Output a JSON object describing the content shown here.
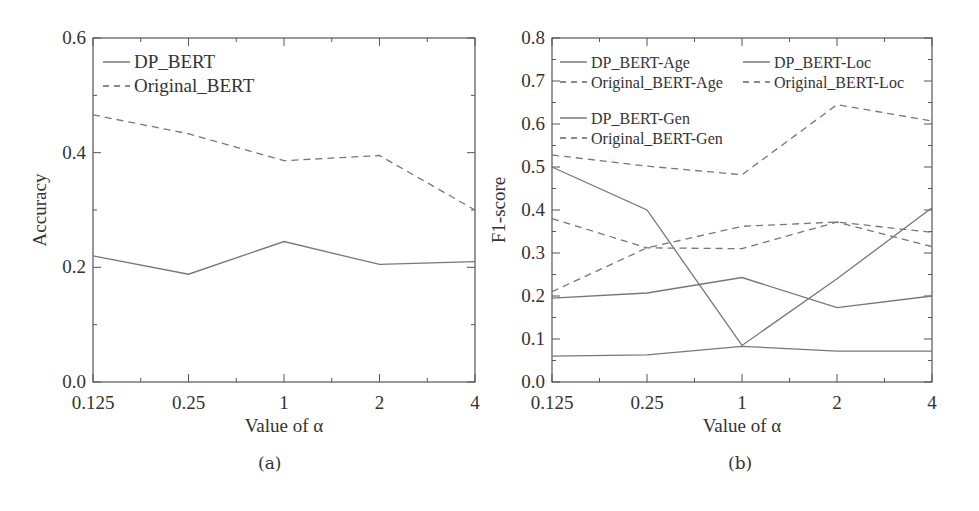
{
  "chart_data": [
    {
      "id": "a",
      "type": "line",
      "caption": "(a)",
      "title": "",
      "xlabel": "Value of α",
      "ylabel": "Accuracy",
      "categories": [
        "0.125",
        "0.25",
        "1",
        "2",
        "4"
      ],
      "ylim": [
        0,
        0.6
      ],
      "yticks": [
        "0.0",
        "0.2",
        "0.4",
        "0.6"
      ],
      "grid": false,
      "legend_position": "upper left",
      "series": [
        {
          "name": "DP_BERT",
          "style": "solid",
          "values": [
            0.22,
            0.188,
            0.245,
            0.205,
            0.21
          ]
        },
        {
          "name": "Original_BERT",
          "style": "dashed",
          "values": [
            0.466,
            0.433,
            0.386,
            0.395,
            0.3
          ]
        }
      ]
    },
    {
      "id": "b",
      "type": "line",
      "caption": "(b)",
      "title": "",
      "xlabel": "Value of α",
      "ylabel": "F1-score",
      "categories": [
        "0.125",
        "0.25",
        "1",
        "2",
        "4"
      ],
      "ylim": [
        0,
        0.8
      ],
      "yticks": [
        "0.0",
        "0.1",
        "0.2",
        "0.3",
        "0.4",
        "0.5",
        "0.6",
        "0.7",
        "0.8"
      ],
      "grid": false,
      "legend_position": "upper left (3 groups)",
      "series": [
        {
          "name": "DP_BERT-Age",
          "style": "solid",
          "values": [
            0.5,
            0.4,
            0.085,
            0.24,
            0.405
          ]
        },
        {
          "name": "Original_BERT-Age",
          "style": "dashed",
          "values": [
            0.528,
            0.502,
            0.482,
            0.645,
            0.607
          ]
        },
        {
          "name": "DP_BERT-Loc",
          "style": "solid",
          "values": [
            0.06,
            0.063,
            0.083,
            0.072,
            0.072
          ]
        },
        {
          "name": "Original_BERT-Loc",
          "style": "dashed",
          "values": [
            0.38,
            0.312,
            0.31,
            0.372,
            0.315
          ]
        },
        {
          "name": "DP_BERT-Gen",
          "style": "solid",
          "values": [
            0.195,
            0.207,
            0.243,
            0.173,
            0.2
          ]
        },
        {
          "name": "Original_BERT-Gen",
          "style": "dashed",
          "values": [
            0.21,
            0.312,
            0.362,
            0.372,
            0.348
          ]
        }
      ]
    }
  ]
}
